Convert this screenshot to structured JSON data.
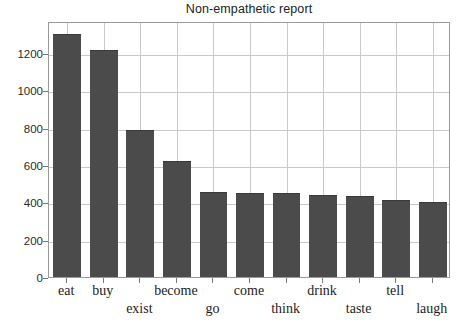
{
  "chart_data": {
    "type": "bar",
    "title": "Non-empathetic report",
    "xlabel": "",
    "ylabel": "",
    "categories": [
      "eat",
      "buy",
      "exist",
      "become",
      "go",
      "come",
      "think",
      "drink",
      "taste",
      "tell",
      "laugh"
    ],
    "values": [
      1300,
      1215,
      785,
      620,
      455,
      450,
      448,
      437,
      432,
      412,
      400
    ],
    "ylim": [
      0,
      1370
    ],
    "yticks": [
      0,
      200,
      400,
      600,
      800,
      1000,
      1200
    ],
    "ytick_labels": [
      "0",
      "200",
      "400",
      "600",
      "800",
      "1000",
      "1200"
    ],
    "grid": true,
    "legend": null,
    "bar_color": "#4b4b4b",
    "grid_color": "#c9c9c9",
    "frame_color": "#9a9a9a",
    "label_rows": [
      0,
      0,
      1,
      0,
      1,
      0,
      1,
      0,
      1,
      0,
      1
    ]
  }
}
